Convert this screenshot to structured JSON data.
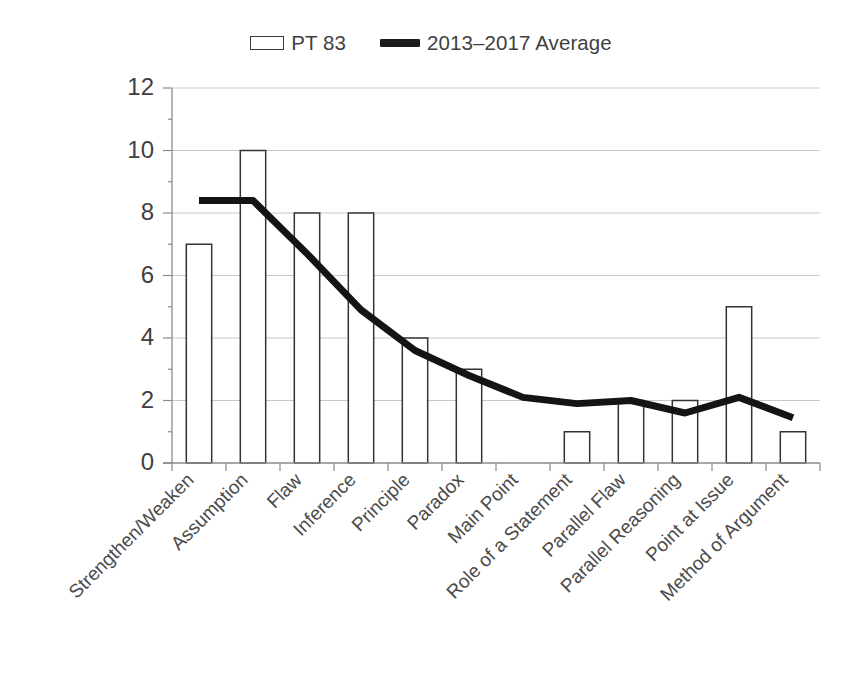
{
  "legend": {
    "position": "top-center",
    "entries": [
      {
        "label": "PT 83",
        "marker": "hollow-rect-swatch"
      },
      {
        "label": "2013–2017 Average",
        "marker": "thick-line-swatch"
      }
    ]
  },
  "axis": {
    "y_ticks": [
      "0",
      "2",
      "4",
      "6",
      "8",
      "10",
      "12"
    ],
    "y_min": 0,
    "y_max": 12,
    "y_step": 2
  },
  "colors": {
    "background": "#ffffff",
    "bar_fill": "#ffffff",
    "bar_stroke": "#333333",
    "line": "#141414",
    "gridline": "#c8c8c8",
    "axis": "#8a8a8a",
    "text": "#3f3f3f"
  },
  "chart_data": {
    "type": "bar",
    "title": "",
    "subtitle": "",
    "xlabel": "",
    "ylabel": "",
    "ylim": [
      0,
      12
    ],
    "ytick_step": 2,
    "grid": true,
    "legend_position": "top-center",
    "categories": [
      "Strengthen/Weaken",
      "Assumption",
      "Flaw",
      "Inference",
      "Principle",
      "Paradox",
      "Main Point",
      "Role of a Statement",
      "Parallel Flaw",
      "Parallel Reasoning",
      "Point at Issue",
      "Method of Argument"
    ],
    "series": [
      {
        "name": "PT 83",
        "type": "bar",
        "values": [
          7,
          10,
          8,
          8,
          4,
          3,
          0,
          1,
          2,
          2,
          5,
          1
        ]
      },
      {
        "name": "2013–2017 Average",
        "type": "line",
        "values": [
          8.4,
          8.4,
          6.7,
          4.9,
          3.6,
          2.8,
          2.1,
          1.9,
          2.0,
          1.6,
          2.1,
          1.45
        ]
      }
    ]
  }
}
